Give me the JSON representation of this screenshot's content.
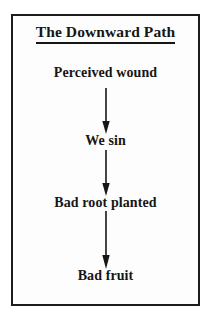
{
  "diagram": {
    "title": "The Downward Path",
    "background_color": "#fdfdfd",
    "border_color": "#1c1c1c",
    "text_color": "#161616",
    "nodes": [
      {
        "label": "Perceived wound"
      },
      {
        "label": "We sin"
      },
      {
        "label": "Bad root planted"
      },
      {
        "label": "Bad fruit"
      }
    ],
    "connectors": [
      {
        "icon": "down-arrow-icon",
        "from": "Perceived wound",
        "to": "We sin"
      },
      {
        "icon": "down-arrow-icon",
        "from": "We sin",
        "to": "Bad root planted"
      },
      {
        "icon": "down-arrow-icon",
        "from": "Bad root planted",
        "to": "Bad fruit"
      }
    ]
  }
}
